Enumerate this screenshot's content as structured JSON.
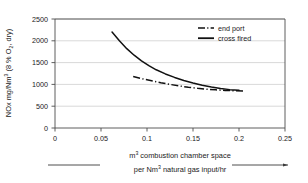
{
  "chart_data": {
    "type": "line",
    "title": "",
    "ylabel": "NOx mg/Nm³ (8 % O₂, dry)",
    "ylabel_parts": {
      "pre": "NOx mg/Nm",
      "sup": "3",
      "post": " (8 % O",
      "sub": "2",
      "tail": ", dry)"
    },
    "xlabel": "m³ combustion chamber space per Nm³ natural gas input/hr",
    "xlabel_line1_pre": "m",
    "xlabel_line1_sup": "3",
    "xlabel_line1_post": " combustion chamber space",
    "xlabel_line2_pre": "per Nm",
    "xlabel_line2_sup": "3",
    "xlabel_line2_post": " natural gas input/hr",
    "xlim": [
      0,
      0.25
    ],
    "ylim": [
      0,
      2500
    ],
    "xticks": [
      0,
      0.05,
      0.1,
      0.15,
      0.2,
      0.25
    ],
    "xticklabels": [
      "0",
      "0.05",
      "0.1",
      "0.15",
      "0.2",
      "0.25"
    ],
    "yticks": [
      0,
      500,
      1000,
      1500,
      2000,
      2500
    ],
    "yticklabels": [
      "0",
      "500",
      "1000",
      "1500",
      "2000",
      "2500"
    ],
    "grid": "horizontal",
    "legend_position": "top-right",
    "series": [
      {
        "name": "end port",
        "style": "dash-dot",
        "color": "#111111",
        "points": [
          [
            0.085,
            1180
          ],
          [
            0.095,
            1130
          ],
          [
            0.105,
            1085
          ],
          [
            0.115,
            1040
          ],
          [
            0.125,
            1000
          ],
          [
            0.135,
            965
          ],
          [
            0.145,
            935
          ],
          [
            0.155,
            910
          ],
          [
            0.165,
            890
          ],
          [
            0.175,
            875
          ],
          [
            0.185,
            862
          ],
          [
            0.195,
            855
          ],
          [
            0.205,
            850
          ]
        ]
      },
      {
        "name": "cross fired",
        "style": "solid",
        "color": "#111111",
        "points": [
          [
            0.062,
            2200
          ],
          [
            0.07,
            2000
          ],
          [
            0.078,
            1820
          ],
          [
            0.086,
            1670
          ],
          [
            0.094,
            1540
          ],
          [
            0.102,
            1430
          ],
          [
            0.11,
            1335
          ],
          [
            0.12,
            1240
          ],
          [
            0.13,
            1160
          ],
          [
            0.14,
            1090
          ],
          [
            0.15,
            1030
          ],
          [
            0.16,
            980
          ],
          [
            0.17,
            940
          ],
          [
            0.18,
            905
          ],
          [
            0.19,
            880
          ],
          [
            0.2,
            868
          ]
        ]
      }
    ],
    "legend": [
      {
        "label": "end port",
        "style": "dash-dot"
      },
      {
        "label": "cross fired",
        "style": "solid"
      }
    ]
  },
  "colors": {
    "axis": "#4d4d4d",
    "grid": "#c8c8c8",
    "series": "#111111",
    "text": "#1a1a1a",
    "background": "#ffffff"
  }
}
